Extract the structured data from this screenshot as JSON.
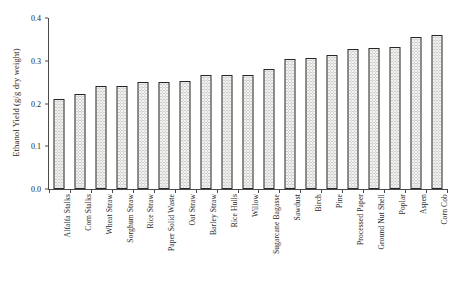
{
  "chart_data": {
    "type": "bar",
    "title": "",
    "xlabel": "",
    "ylabel": "Ethanol Yield (g/g dry weight)",
    "ylim": [
      0.0,
      0.4
    ],
    "ytick_labels": [
      "0.0",
      "0.1",
      "0.2",
      "0.3",
      "0.4"
    ],
    "ytick_values": [
      0.0,
      0.1,
      0.2,
      0.3,
      0.4
    ],
    "grid": false,
    "legend": null,
    "bar_style": {
      "fill": "#f2f2f0",
      "pattern": "stippled-dots",
      "edge_color": "#272727"
    },
    "categories": [
      "Alfalfa Stalks",
      "Corn Stalks",
      "Wheat Straw",
      "Sorghum Straw",
      "Rice Straw",
      "Paper Solid Waste",
      "Oat Straw",
      "Barley Straw",
      "Rice Hulls",
      "Willow",
      "Sugarcane Bagasse",
      "Sawdust",
      "Birch",
      "Pine",
      "Processed Paper",
      "Ground Nut Shell",
      "Poplar",
      "Aspen",
      "Corn Cob"
    ],
    "values": [
      0.21,
      0.222,
      0.24,
      0.241,
      0.25,
      0.25,
      0.253,
      0.266,
      0.266,
      0.267,
      0.28,
      0.305,
      0.306,
      0.313,
      0.327,
      0.33,
      0.333,
      0.355,
      0.36
    ]
  }
}
